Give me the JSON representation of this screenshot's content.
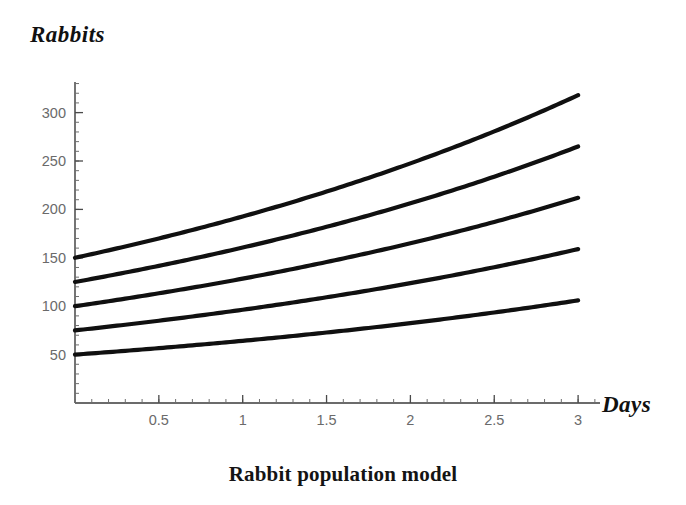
{
  "caption": "Rabbit population model",
  "axis_titles": {
    "y": "Rabbits",
    "x": "Days"
  },
  "colors": {
    "curve": "#101010",
    "axis": "#3a3a3a",
    "tick_label": "#6a6a6a",
    "background": "#ffffff",
    "caption": "#141414"
  },
  "chart_data": {
    "type": "line",
    "title": "Rabbit population model",
    "xlabel": "Days",
    "ylabel": "Rabbits",
    "xlim": [
      0,
      3.1
    ],
    "ylim": [
      0,
      335
    ],
    "grid": false,
    "legend": "none",
    "x_ticks": [
      0.5,
      1,
      1.5,
      2,
      2.5,
      3
    ],
    "x_tick_labels": [
      "0.5",
      "1",
      "1.5",
      "2",
      "2.5",
      "3"
    ],
    "x_minor_tick_step": 0.1,
    "y_ticks": [
      50,
      100,
      150,
      200,
      250,
      300
    ],
    "y_tick_labels": [
      "50",
      "100",
      "150",
      "200",
      "250",
      "300"
    ],
    "y_minor_tick_step": 10,
    "model": "exponential growth: P(t) = P0 * exp(k*t), k = 0.25 per day",
    "x": [
      0,
      0.25,
      0.5,
      0.75,
      1,
      1.25,
      1.5,
      1.75,
      2,
      2.25,
      2.5,
      2.75,
      3
    ],
    "series": [
      {
        "name": "P0 = 150",
        "initial_value": 150,
        "final_value": 318,
        "values": [
          150,
          159.7,
          169.9,
          180.9,
          192.6,
          204.9,
          218.2,
          232.2,
          247.3,
          263.2,
          280.1,
          298.2,
          317.5
        ]
      },
      {
        "name": "P0 = 125",
        "initial_value": 125,
        "final_value": 265,
        "values": [
          125,
          133.1,
          141.6,
          150.7,
          160.5,
          170.8,
          181.8,
          193.5,
          206.0,
          219.3,
          233.4,
          248.5,
          264.6
        ]
      },
      {
        "name": "P0 = 100",
        "initial_value": 100,
        "final_value": 212,
        "values": [
          100,
          106.5,
          113.3,
          120.6,
          128.4,
          136.6,
          145.5,
          154.8,
          164.9,
          175.5,
          186.8,
          198.8,
          211.7
        ]
      },
      {
        "name": "P0 = 75",
        "initial_value": 75,
        "final_value": 159,
        "values": [
          75,
          79.8,
          85.0,
          90.5,
          96.3,
          102.5,
          109.1,
          116.1,
          123.6,
          131.6,
          140.1,
          149.1,
          158.8
        ]
      },
      {
        "name": "P0 = 50",
        "initial_value": 50,
        "final_value": 106,
        "values": [
          50,
          53.2,
          56.7,
          60.3,
          64.2,
          68.3,
          72.7,
          77.4,
          82.4,
          87.7,
          93.4,
          99.4,
          105.8
        ]
      }
    ]
  }
}
